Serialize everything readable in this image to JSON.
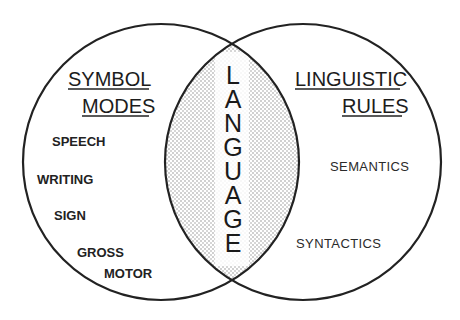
{
  "diagram": {
    "type": "venn",
    "center_label": "LANGUAGE",
    "center_letters": [
      "L",
      "A",
      "N",
      "G",
      "U",
      "A",
      "G",
      "E"
    ],
    "left_set": {
      "title_line1": "SYMBOL",
      "title_line2": "MODES",
      "items": [
        "SPEECH",
        "WRITING",
        "SIGN",
        "GROSS",
        "MOTOR"
      ]
    },
    "right_set": {
      "title_line1": "LINGUISTIC",
      "title_line2": "RULES",
      "items": [
        "SEMANTICS",
        "SYNTACTICS"
      ]
    },
    "colors": {
      "line": "#222222",
      "text": "#1c1c1c",
      "shading_dot": "#8a8a8a",
      "background": "#ffffff"
    }
  }
}
